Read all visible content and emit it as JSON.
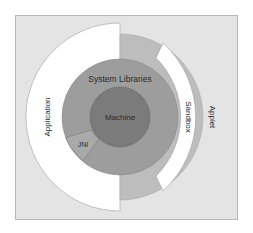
{
  "diagram": {
    "type": "concentric-layers",
    "labels": {
      "machine": "Machine",
      "system_libraries": "System Libraries",
      "jni": "JNI",
      "sandbox": "Sandbox",
      "application": "Application",
      "applet": "Applet"
    },
    "colors": {
      "frame_bg": "#e4e4e4",
      "frame_border": "#b8b8b8",
      "application_fill": "#ffffff",
      "applet_fill": "#ffffff",
      "sandbox_fill": "#bdbdbd",
      "system_libraries_fill": "#9d9d9d",
      "jni_fill": "#a9a9a9",
      "machine_fill": "#7b7b7b",
      "stroke": "#8a8a8a"
    }
  }
}
